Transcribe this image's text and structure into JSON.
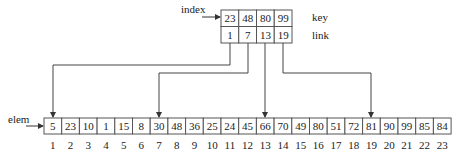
{
  "index_table": {
    "label": "index",
    "key_label": "key",
    "link_label": "link",
    "keys": [
      "23",
      "48",
      "80",
      "99"
    ],
    "links": [
      "1",
      "7",
      "13",
      "19"
    ]
  },
  "elem_array": {
    "label": "elem",
    "values": [
      "5",
      "23",
      "10",
      "1",
      "15",
      "8",
      "30",
      "48",
      "36",
      "25",
      "24",
      "45",
      "66",
      "70",
      "49",
      "80",
      "51",
      "72",
      "81",
      "90",
      "99",
      "85",
      "84"
    ],
    "positions": [
      "1",
      "2",
      "3",
      "4",
      "5",
      "6",
      "7",
      "8",
      "9",
      "10",
      "11",
      "12",
      "13",
      "14",
      "15",
      "16",
      "17",
      "18",
      "19",
      "20",
      "21",
      "22",
      "23"
    ]
  },
  "colors": {
    "line": "#444444",
    "text": "#222222",
    "border": "#555555"
  }
}
